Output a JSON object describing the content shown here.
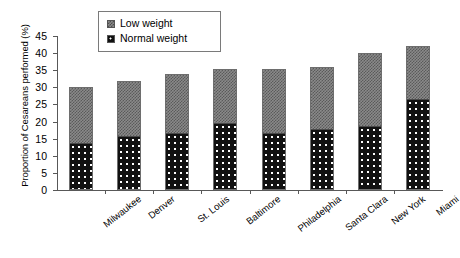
{
  "chart_data": {
    "type": "bar",
    "stacked": true,
    "title": "",
    "xlabel": "",
    "ylabel": "Proportion of Cesareans performed (%)",
    "ylim": [
      0,
      45
    ],
    "yticks": [
      0,
      5,
      10,
      15,
      20,
      25,
      30,
      35,
      40,
      45
    ],
    "grid": false,
    "legend_position": "top-center",
    "categories": [
      "Milwaukee",
      "Denver",
      "St. Louis",
      "Baltimore",
      "Philadelphia",
      "Santa Clara",
      "New York",
      "Miami"
    ],
    "series": [
      {
        "name": "Normal weight",
        "values": [
          14,
          16,
          17,
          20,
          17,
          18,
          19,
          27
        ],
        "color": "#111111",
        "pattern": "black-with-white-dots"
      },
      {
        "name": "Low weight",
        "values": [
          16,
          16,
          17,
          15.5,
          18.5,
          18,
          21,
          15
        ],
        "color": "#8a8a8a",
        "pattern": "gray-checkerboard"
      }
    ],
    "totals": [
      30,
      32,
      34,
      35.5,
      35.5,
      36,
      40,
      42
    ]
  },
  "legend": {
    "items": [
      {
        "label": "Low weight",
        "swatch": "low"
      },
      {
        "label": "Normal weight",
        "swatch": "normal"
      }
    ]
  },
  "axis": {
    "y_title": "Proportion of Cesareans performed (%)"
  }
}
